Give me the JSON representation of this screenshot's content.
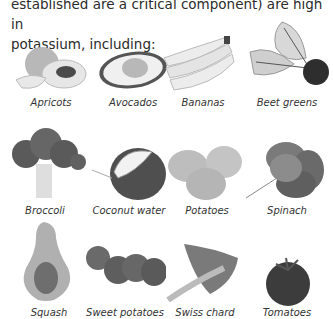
{
  "intro": {
    "line1": "established are a critical component) are high in",
    "line2": "potassium, including:"
  },
  "foods": [
    {
      "name": "Apricots"
    },
    {
      "name": "Avocados"
    },
    {
      "name": "Bananas"
    },
    {
      "name": "Beet greens"
    },
    {
      "name": "Broccoli"
    },
    {
      "name": "Coconut water"
    },
    {
      "name": "Potatoes"
    },
    {
      "name": "Spinach"
    },
    {
      "name": "Squash"
    },
    {
      "name": "Sweet potatoes"
    },
    {
      "name": "Swiss chard"
    },
    {
      "name": "Tomatoes"
    }
  ]
}
